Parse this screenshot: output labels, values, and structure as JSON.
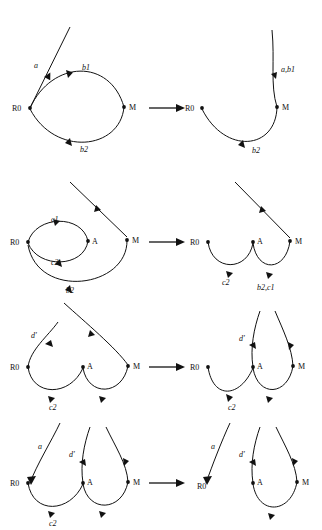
{
  "figure": {
    "type": "graph-transformation-sequence",
    "background_color": "#ffffff",
    "ink_color": "#111111",
    "rows": 4,
    "panels_per_row": 2,
    "transition_symbol": "arrow-right"
  },
  "rows": [
    {
      "id": "row-1",
      "left": {
        "nodes": [
          {
            "id": "R0",
            "label": "R0"
          },
          {
            "id": "M",
            "label": "M"
          }
        ],
        "edges": [
          {
            "label": "a",
            "from": "R0",
            "to": "up-right-open"
          },
          {
            "label": "b1",
            "from": "R0",
            "to": "M"
          },
          {
            "label": "b2",
            "from": "M",
            "to": "R0"
          }
        ]
      },
      "right": {
        "nodes": [
          {
            "id": "R0",
            "label": "R0"
          },
          {
            "id": "M",
            "label": "M"
          }
        ],
        "edges": [
          {
            "label": "a,b1",
            "from": "M",
            "to": "up-right-open"
          },
          {
            "label": "b2",
            "from": "M",
            "to": "R0"
          }
        ]
      }
    },
    {
      "id": "row-2",
      "left": {
        "nodes": [
          {
            "id": "R0",
            "label": "R0"
          },
          {
            "id": "A",
            "label": "A"
          },
          {
            "id": "M",
            "label": "M"
          }
        ],
        "edges": [
          {
            "label": "c1",
            "from": "R0",
            "to": "A"
          },
          {
            "label": "c2",
            "from": "A",
            "to": "R0"
          },
          {
            "label": "b2",
            "from": "M",
            "to": "R0"
          },
          {
            "label": "",
            "from": "M",
            "to": "up-left-open"
          }
        ]
      },
      "right": {
        "nodes": [
          {
            "id": "R0",
            "label": "R0"
          },
          {
            "id": "A",
            "label": "A"
          },
          {
            "id": "M",
            "label": "M"
          }
        ],
        "edges": [
          {
            "label": "c2",
            "from": "R0",
            "to": "A"
          },
          {
            "label": "b2,c1",
            "from": "A",
            "to": "M"
          },
          {
            "label": "",
            "from": "M",
            "to": "up-left-open"
          }
        ]
      }
    },
    {
      "id": "row-3",
      "left": {
        "nodes": [
          {
            "id": "R0",
            "label": "R0"
          },
          {
            "id": "A",
            "label": "A"
          },
          {
            "id": "M",
            "label": "M"
          }
        ],
        "edges": [
          {
            "label": "d'",
            "from": "R0",
            "to": "up-right-open"
          },
          {
            "label": "c2",
            "from": "R0",
            "to": "A"
          },
          {
            "label": "",
            "from": "A",
            "to": "M"
          },
          {
            "label": "",
            "from": "M",
            "to": "up-left-open"
          }
        ]
      },
      "right": {
        "nodes": [
          {
            "id": "R0",
            "label": "R0"
          },
          {
            "id": "A",
            "label": "A"
          },
          {
            "id": "M",
            "label": "M"
          }
        ],
        "edges": [
          {
            "label": "c2",
            "from": "R0",
            "to": "A"
          },
          {
            "label": "d'",
            "from": "A",
            "to": "up-open"
          },
          {
            "label": "",
            "from": "A",
            "to": "M"
          },
          {
            "label": "",
            "from": "M",
            "to": "up-open"
          }
        ]
      }
    },
    {
      "id": "row-4",
      "left": {
        "nodes": [
          {
            "id": "R0",
            "label": "R0"
          },
          {
            "id": "A",
            "label": "A"
          },
          {
            "id": "M",
            "label": "M"
          }
        ],
        "edges": [
          {
            "label": "a",
            "from": "up-right-open",
            "to": "R0"
          },
          {
            "label": "c2",
            "from": "R0",
            "to": "A"
          },
          {
            "label": "d'",
            "from": "A",
            "to": "up-open"
          },
          {
            "label": "",
            "from": "A",
            "to": "M"
          },
          {
            "label": "",
            "from": "M",
            "to": "up-open"
          }
        ]
      },
      "right": {
        "nodes": [
          {
            "id": "R0",
            "label": "R0"
          },
          {
            "id": "A",
            "label": "A"
          },
          {
            "id": "M",
            "label": "M"
          }
        ],
        "edges": [
          {
            "label": "a",
            "from": "up-right-open",
            "to": "R0"
          },
          {
            "label": "d'",
            "from": "A",
            "to": "up-open"
          },
          {
            "label": "",
            "from": "A",
            "to": "M"
          },
          {
            "label": "",
            "from": "M",
            "to": "up-open"
          }
        ]
      }
    }
  ],
  "labels": {
    "r1_l_a": "a",
    "r1_l_b1": "b1",
    "r1_l_b2": "b2",
    "r1_l_R0": "R0",
    "r1_l_M": "M",
    "r1_r_ab1": "a,b1",
    "r1_r_b2": "b2",
    "r1_r_R0": "R0",
    "r1_r_M": "M",
    "r2_l_c1": "c1",
    "r2_l_c2": "c2",
    "r2_l_b2": "b2",
    "r2_l_R0": "R0",
    "r2_l_A": "A",
    "r2_l_M": "M",
    "r2_r_c2": "c2",
    "r2_r_b2c1": "b2,c1",
    "r2_r_R0": "R0",
    "r2_r_A": "A",
    "r2_r_M": "M",
    "r3_l_d": "d'",
    "r3_l_c2": "c2",
    "r3_l_R0": "R0",
    "r3_l_A": "A",
    "r3_l_M": "M",
    "r3_r_d": "d'",
    "r3_r_c2": "c2",
    "r3_r_R0": "R0",
    "r3_r_A": "A",
    "r3_r_M": "M",
    "r4_l_a": "a",
    "r4_l_d": "d'",
    "r4_l_c2": "c2",
    "r4_l_R0": "R0",
    "r4_l_A": "A",
    "r4_l_M": "M",
    "r4_r_a": "a",
    "r4_r_d": "d'",
    "r4_r_R0": "R0",
    "r4_r_A": "A",
    "r4_r_M": "M"
  }
}
